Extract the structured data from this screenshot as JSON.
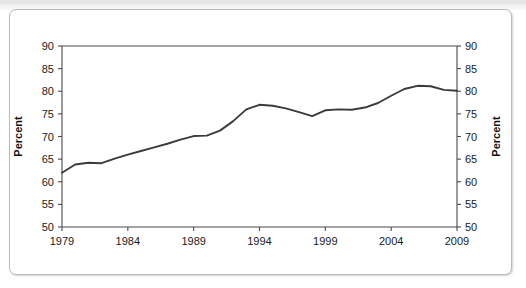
{
  "figure": {
    "background_color": "#ffffff",
    "frame_color": "#b9b9b9",
    "line_color": "#3b3b3b"
  },
  "chart_data": {
    "type": "line",
    "title": "",
    "xlabel": "",
    "ylabel": "Percent",
    "ylabel_right": "Percent",
    "xlim": [
      1979,
      2009
    ],
    "ylim": [
      50,
      90
    ],
    "grid": false,
    "legend": null,
    "x_ticks": [
      1979,
      1984,
      1989,
      1994,
      1999,
      2004,
      2009
    ],
    "x_tick_labels": [
      "1979",
      "1984",
      "1989",
      "1994",
      "1999",
      "2004",
      "2009"
    ],
    "y_ticks": [
      50,
      55,
      60,
      65,
      70,
      75,
      80,
      85,
      90
    ],
    "y_tick_labels": [
      "50",
      "55",
      "60",
      "65",
      "70",
      "75",
      "80",
      "85",
      "90"
    ],
    "y_ticks_right": [
      50,
      55,
      60,
      65,
      70,
      75,
      80,
      85,
      90
    ],
    "y_tick_labels_right": [
      "50",
      "55",
      "60",
      "65",
      "70",
      "75",
      "80",
      "85",
      "90"
    ],
    "x": [
      1979,
      1980,
      1981,
      1982,
      1983,
      1984,
      1985,
      1986,
      1987,
      1988,
      1989,
      1990,
      1991,
      1992,
      1993,
      1994,
      1995,
      1996,
      1997,
      1998,
      1999,
      2000,
      2001,
      2002,
      2003,
      2004,
      2005,
      2006,
      2007,
      2008,
      2009
    ],
    "values": [
      62.0,
      63.8,
      64.2,
      64.1,
      65.1,
      66.0,
      66.8,
      67.6,
      68.4,
      69.3,
      70.1,
      70.2,
      71.3,
      73.4,
      76.0,
      77.0,
      76.8,
      76.2,
      75.4,
      74.5,
      75.8,
      76.0,
      75.9,
      76.4,
      77.4,
      79.0,
      80.5,
      81.2,
      81.1,
      80.3,
      80.1
    ],
    "series_name": "Percent"
  }
}
